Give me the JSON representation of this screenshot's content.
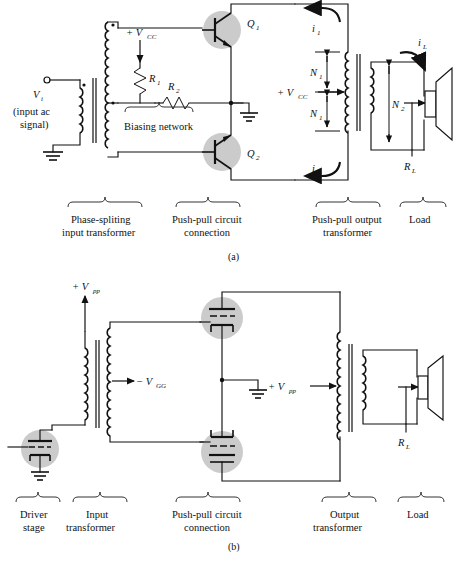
{
  "figure": {
    "panels": [
      {
        "id": "a",
        "panel_label": "(a)",
        "labels": {
          "vi": "V",
          "vi_sub": "i",
          "vi_desc_line1": "(input ac",
          "vi_desc_line2": "signal)",
          "vcc_left": "+ V",
          "vcc_left_sub": "CC",
          "r1": "R",
          "r1_sub": "1",
          "r2": "R",
          "r2_sub": "2",
          "biasing_network": "Biasing network",
          "q1": "Q",
          "q1_sub": "1",
          "q2": "Q",
          "q2_sub": "2",
          "i1": "i",
          "i1_sub": "1",
          "i2": "i",
          "i2_sub": "2",
          "vcc_right": "+ V",
          "vcc_right_sub": "CC",
          "n1_top": "N",
          "n1_top_sub": "1",
          "n1_bot": "N",
          "n1_bot_sub": "1",
          "n2": "N",
          "n2_sub": "2",
          "il": "i",
          "il_sub": "L",
          "rl": "R",
          "rl_sub": "L"
        },
        "sections": [
          {
            "name": "phase-splitting-input-transformer",
            "line1": "Phase-spliting",
            "line2": "input transformer"
          },
          {
            "name": "push-pull-circuit-connection",
            "line1": "Push-pull circuit",
            "line2": "connection"
          },
          {
            "name": "push-pull-output-transformer",
            "line1": "Push-pull output",
            "line2": "transformer"
          },
          {
            "name": "load",
            "line1": "Load",
            "line2": ""
          }
        ]
      },
      {
        "id": "b",
        "panel_label": "(b)",
        "labels": {
          "vpp_left": "+ V",
          "vpp_left_sub": "pp",
          "vgg": "− V",
          "vgg_sub": "GG",
          "vpp_right": "+ V",
          "vpp_right_sub": "pp",
          "rl": "R",
          "rl_sub": "L"
        },
        "sections": [
          {
            "name": "driver-stage",
            "line1": "Driver",
            "line2": "stage"
          },
          {
            "name": "input-transformer",
            "line1": "Input",
            "line2": "transformer"
          },
          {
            "name": "push-pull-circuit-connection",
            "line1": "Push-pull circuit",
            "line2": "connection"
          },
          {
            "name": "output-transformer",
            "line1": "Output",
            "line2": "transformer"
          },
          {
            "name": "load",
            "line1": "Load",
            "line2": ""
          }
        ]
      }
    ],
    "colors": {
      "ink": "#111111",
      "device_highlight": "#cbcbcb",
      "background": "#ffffff"
    }
  }
}
